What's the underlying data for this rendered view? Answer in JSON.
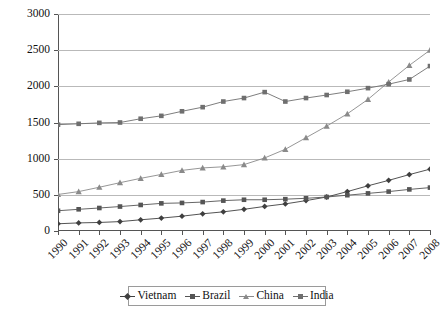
{
  "chart_data": {
    "type": "line",
    "title": "",
    "xlabel": "",
    "ylabel": "",
    "ylim": [
      0,
      3000
    ],
    "ytick_values": [
      0,
      500,
      1000,
      1500,
      2000,
      2500,
      3000
    ],
    "ytick_labels": [
      "0",
      "500",
      "1000",
      "1500",
      "2000",
      "2500",
      "3000"
    ],
    "grid": true,
    "legend_position": "bottom",
    "categories": [
      "1990",
      "1991",
      "1992",
      "1993",
      "1994",
      "1995",
      "1996",
      "1997",
      "1998",
      "1999",
      "2000",
      "2001",
      "2002",
      "2003",
      "2004",
      "2005",
      "2006",
      "2007",
      "2008"
    ],
    "series": [
      {
        "name": "Vietnam",
        "marker": "diamond",
        "color": "#3f3f3f",
        "values": [
          100,
          112,
          118,
          130,
          155,
          178,
          205,
          238,
          265,
          300,
          340,
          375,
          420,
          470,
          545,
          625,
          700,
          780,
          855
        ]
      },
      {
        "name": "Brazil",
        "marker": "square",
        "color": "#555555",
        "values": [
          280,
          300,
          318,
          338,
          360,
          382,
          388,
          400,
          420,
          432,
          432,
          440,
          452,
          470,
          495,
          520,
          545,
          575,
          600
        ]
      },
      {
        "name": "China",
        "marker": "triangle",
        "color": "#8a8a8a",
        "values": [
          505,
          545,
          605,
          668,
          728,
          782,
          838,
          872,
          888,
          918,
          1010,
          1130,
          1290,
          1450,
          1620,
          1820,
          2060,
          2290,
          2500
        ]
      },
      {
        "name": "India",
        "marker": "square",
        "color": "#6f6f6f",
        "values": [
          1470,
          1482,
          1495,
          1500,
          1552,
          1592,
          1655,
          1712,
          1790,
          1838,
          1920,
          1790,
          1838,
          1880,
          1925,
          1975,
          2030,
          2095,
          2280
        ]
      }
    ]
  },
  "legend": {
    "items": [
      {
        "label": "Vietnam"
      },
      {
        "label": "Brazil"
      },
      {
        "label": "China"
      },
      {
        "label": "India"
      }
    ]
  }
}
